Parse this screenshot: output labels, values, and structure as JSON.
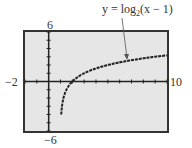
{
  "chart_data": {
    "type": "line",
    "title": "",
    "annotation": "y = log2(x − 1)",
    "annotation_parts": {
      "pre": "y = log",
      "sub": "2",
      "post": "(x − 1)"
    },
    "xlabel": "",
    "ylabel": "",
    "xlim": [
      -2,
      10
    ],
    "ylim": [
      -6,
      6
    ],
    "xscale": 1,
    "yscale": 1,
    "tick_labels": {
      "xmin": "−2",
      "xmax": "10",
      "ymax": "6",
      "ymin": "−6"
    },
    "grid": false,
    "series": [
      {
        "name": "y = log2(x − 1)",
        "x": [
          1.0625,
          1.125,
          1.25,
          1.5,
          2,
          3,
          4,
          5,
          6,
          7,
          8,
          9,
          10
        ],
        "values": [
          -4,
          -3,
          -2,
          -1,
          0,
          1,
          1.585,
          2,
          2.322,
          2.585,
          2.807,
          3,
          3.17
        ]
      }
    ]
  },
  "colors": {
    "screen_bg": "#e6e6e6",
    "frame": "#333333",
    "curve": "#222222"
  }
}
